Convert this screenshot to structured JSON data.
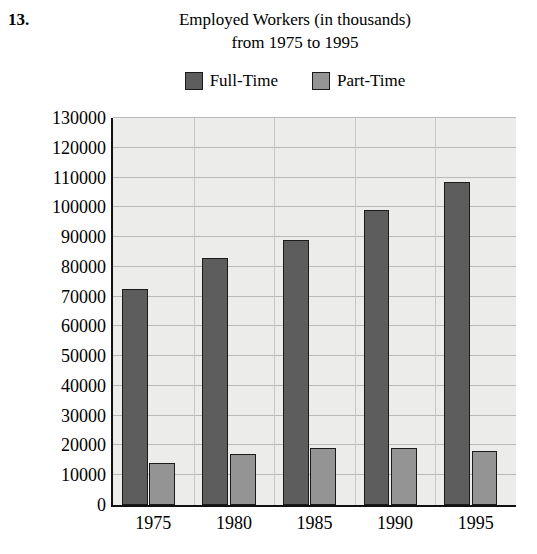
{
  "problem": {
    "number": "13."
  },
  "chart_data": {
    "type": "bar",
    "title": "Employed Workers (in thousands)\nfrom 1975 to 1995",
    "title_lines": [
      "Employed Workers (in thousands)",
      "from 1975 to 1995"
    ],
    "xlabel": "",
    "ylabel": "",
    "categories": [
      "1975",
      "1980",
      "1985",
      "1990",
      "1995"
    ],
    "series": [
      {
        "name": "Full-Time",
        "color": "#5d5d5d",
        "values": [
          72500,
          83000,
          89000,
          99000,
          108500
        ]
      },
      {
        "name": "Part-Time",
        "color": "#949494",
        "values": [
          14200,
          17000,
          19000,
          19000,
          18000
        ]
      }
    ],
    "ylim": [
      0,
      130000
    ],
    "ytick_step": 10000,
    "yticks": [
      "0",
      "10000",
      "20000",
      "30000",
      "40000",
      "50000",
      "60000",
      "70000",
      "80000",
      "90000",
      "100000",
      "110000",
      "120000",
      "130000"
    ],
    "grid": true,
    "legend_position": "top",
    "plot_background": "#ececeb"
  }
}
